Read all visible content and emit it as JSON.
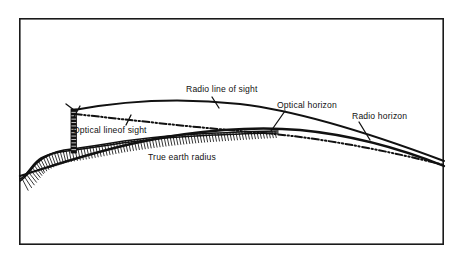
{
  "figure": {
    "background_color": "#ffffff",
    "ink_color": "#111111",
    "frame": {
      "x": 19,
      "y": 18,
      "width": 425,
      "height": 227
    }
  },
  "labels": {
    "radio_line_of_sight": "Radio line of sight",
    "optical_line_of_sight": "Optical lineof sight",
    "optical_horizon": "Optical horizon",
    "radio_horizon": "Radio horizon",
    "true_earth_radius": "True earth radius"
  },
  "label_positions": {
    "radio_line_of_sight": {
      "x": 186,
      "y": 92,
      "anchor": "start"
    },
    "optical_line_of_sight": {
      "x": 73,
      "y": 133,
      "anchor": "start"
    },
    "optical_horizon": {
      "x": 277,
      "y": 108,
      "anchor": "start"
    },
    "radio_horizon": {
      "x": 352,
      "y": 119,
      "anchor": "start"
    },
    "true_earth_radius": {
      "x": 148,
      "y": 160,
      "anchor": "start"
    }
  },
  "leader_lines": {
    "radio_line_of_sight": "M 212 97 L 219 108",
    "optical_line_of_sight": "M 126 125 L 131 115",
    "optical_horizon": "M 285 111 L 271 131",
    "radio_horizon": "M 359 122 L 370 140",
    "antenna_top_left": "M 66 104 L 74 110",
    "antenna_top_right": "M 80 106 L 74 117"
  },
  "chart_data": {
    "type": "diagram",
    "elements": [
      {
        "name": "earth-curve",
        "label": "True earth radius",
        "style": "solid"
      },
      {
        "name": "radio-horizon-curve",
        "label": "Radio horizon",
        "style": "solid"
      },
      {
        "name": "radio-line-of-sight-curve",
        "label": "Radio line of sight",
        "style": "solid"
      },
      {
        "name": "optical-line-of-sight",
        "label": "Optical lineof sight",
        "style": "dash-dot"
      },
      {
        "name": "terrain",
        "label": "hatched ground",
        "style": "hatched"
      },
      {
        "name": "antenna-tower",
        "label": "transmitting tower",
        "style": "filled"
      }
    ]
  },
  "geometry": {
    "earth_curve": "M 20 176 C 52 166 92 152 140 142 C 196 130 254 126 300 130 C 352 135 404 150 444 166",
    "radio_curve": "M 74 110 C 128 100 186 98 240 104 C 300 111 372 134 444 161",
    "optical_sight": "M 75 114 C 130 120 200 128 264 133 C 330 139 392 152 444 165",
    "terrain_outline": "M 20 181 C 26 178 30 170 36 164 C 42 158 50 154 60 152 C 74 150 96 147 122 143 C 152 139 188 136 214 135 C 240 134 262 133 278 133",
    "terrain_top": "M 20 179 C 27 176 31 167 38 161 C 45 156 54 152 64 150 C 80 148 100 145 124 141 C 154 137 190 134 216 133 C 242 132 264 131 278 131",
    "hill_bump": "M 24 176 C 30 170 34 162 41 158 C 48 154 56 152 64 151",
    "tower": {
      "x": 71,
      "y": 109,
      "width": 5.5,
      "height": 44,
      "rungs": 13
    }
  }
}
